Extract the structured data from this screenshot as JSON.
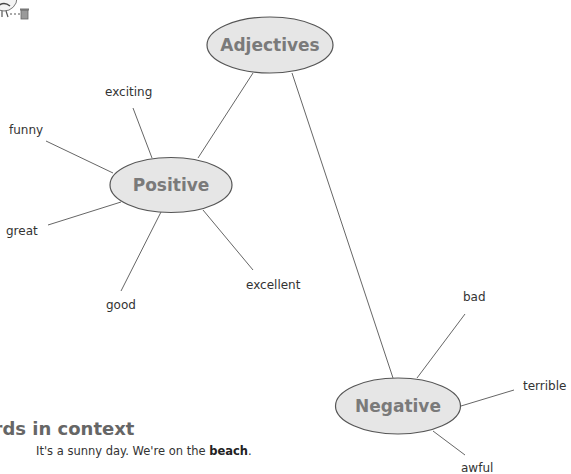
{
  "mascot": {
    "icon": "cartoon-character-with-trash-can-icon"
  },
  "diagram": {
    "title_node": {
      "id": "adjectives",
      "label": "Adjectives"
    },
    "groups": [
      {
        "id": "positive",
        "label": "Positive",
        "words": [
          "exciting",
          "funny",
          "great",
          "good",
          "excellent"
        ]
      },
      {
        "id": "negative",
        "label": "Negative",
        "words": [
          "bad",
          "terrible",
          "awful"
        ]
      }
    ],
    "colors": {
      "node_fill": "#e6e6e6",
      "node_stroke": "#555555",
      "node_text": "#7a7a7a",
      "edge": "#666666"
    }
  },
  "section": {
    "heading": "Words in context",
    "heading_visible": "rds in context",
    "sentence_start": "It's a sunny day. We're on the ",
    "sentence_bold": "beach",
    "sentence_end": "."
  }
}
